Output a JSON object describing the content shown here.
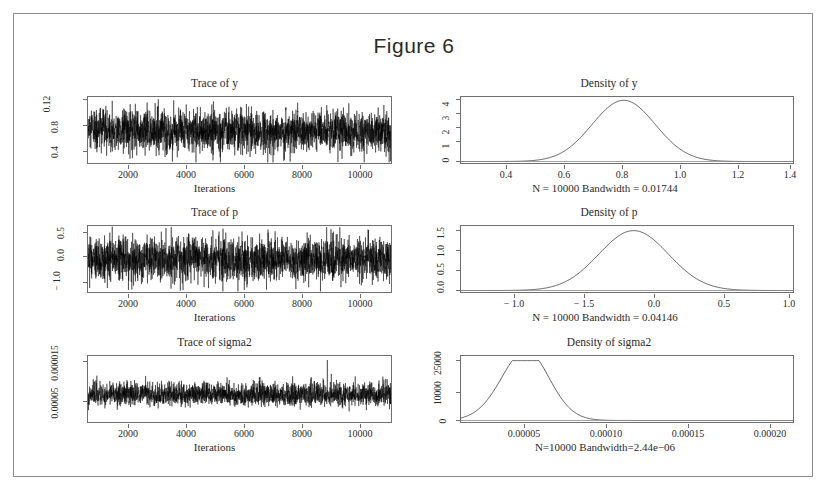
{
  "figure": {
    "title": "Figure 6"
  },
  "panels": [
    {
      "title": "Trace of y",
      "xlabel": "Iterations",
      "xticks": [
        "2000",
        "4000",
        "6000",
        "8000",
        "10000"
      ],
      "yticks": [
        "0.4",
        "0.8",
        "0.12"
      ]
    },
    {
      "title": "Density of y",
      "xlabel": "N = 10000 Bandwidth = 0.01744",
      "xticks": [
        "0.4",
        "0.6",
        "0.8",
        "1.0",
        "1.2",
        "1.4"
      ],
      "yticks": [
        "0",
        "1",
        "2",
        "3",
        "4"
      ]
    },
    {
      "title": "Trace of p",
      "xlabel": "Iterations",
      "xticks": [
        "2000",
        "4000",
        "6000",
        "8000",
        "10000"
      ],
      "yticks": [
        "− 1.0",
        "0.0",
        "0.5"
      ]
    },
    {
      "title": "Density of p",
      "xlabel": "N = 10000 Bandwidth = 0.04146",
      "xticks": [
        "− 1.0",
        "− 1.5",
        "0.0",
        "0.5",
        "1.0"
      ],
      "yticks": [
        "0.0",
        "0.5",
        "1.0",
        "1.5"
      ]
    },
    {
      "title": "Trace of sigma2",
      "xlabel": "Iterations",
      "xticks": [
        "2000",
        "4000",
        "6000",
        "8000",
        "10000"
      ],
      "yticks": [
        "0.00005",
        "0.000015"
      ]
    },
    {
      "title": "Density of sigma2",
      "xlabel": "N=10000 Bandwidth=2.44e−06",
      "xticks": [
        "0.00005",
        "0.00010",
        "0.00015",
        "0.00020"
      ],
      "yticks": [
        "0",
        "10000",
        "25000"
      ]
    }
  ],
  "chart_data": [
    {
      "type": "line",
      "title": "Trace of y",
      "xlabel": "Iterations",
      "ylabel": "y",
      "xlim": [
        1000,
        11000
      ],
      "ylim": [
        0.35,
        1.3
      ],
      "ytick_values": [
        0.4,
        0.8,
        1.2
      ],
      "xtick_values": [
        2000,
        4000,
        6000,
        8000,
        10000
      ],
      "series_description": "MCMC trace, stationary white-noise band centred near 0.83 with spread roughly 0.6 to 1.1",
      "mean": 0.83,
      "sd": 0.105,
      "n": 10000
    },
    {
      "type": "line",
      "title": "Density of y",
      "xlabel": "N = 10000 Bandwidth = 0.01744",
      "ylabel": "Density",
      "xlim": [
        0.27,
        1.42
      ],
      "ylim": [
        0,
        4.2
      ],
      "xtick_values": [
        0.4,
        0.6,
        0.8,
        1.0,
        1.2,
        1.4
      ],
      "ytick_values": [
        0,
        1,
        2,
        3,
        4
      ],
      "series_description": "Unimodal kernel density, peak height about 3.9 at x = 0.83",
      "peak_x": 0.83,
      "peak_y": 3.9,
      "n": 10000,
      "bandwidth": 0.01744
    },
    {
      "type": "line",
      "title": "Trace of p",
      "xlabel": "Iterations",
      "ylabel": "p",
      "xlim": [
        1000,
        11000
      ],
      "ylim": [
        -1.2,
        0.75
      ],
      "ytick_values": [
        -1.0,
        0.0,
        0.5
      ],
      "xtick_values": [
        2000,
        4000,
        6000,
        8000,
        10000
      ],
      "series_description": "MCMC trace, stationary band centred near -0.06 spanning roughly -0.9 to 0.6",
      "mean": -0.06,
      "sd": 0.25,
      "n": 10000
    },
    {
      "type": "line",
      "title": "Density of p",
      "xlabel": "N = 10000 Bandwidth = 0.04146",
      "ylabel": "Density",
      "xlim": [
        -1.25,
        1.05
      ],
      "ylim": [
        0,
        1.75
      ],
      "xtick_values": [
        -1.0,
        -0.5,
        0.0,
        0.5,
        1.0
      ],
      "ytick_values": [
        0.0,
        0.5,
        1.0,
        1.5
      ],
      "series_description": "Unimodal kernel density, peak height about 1.6 at x = -0.06",
      "peak_x": -0.06,
      "peak_y": 1.6,
      "n": 10000,
      "bandwidth": 0.04146
    },
    {
      "type": "line",
      "title": "Trace of sigma2",
      "xlabel": "Iterations",
      "ylabel": "sigma2",
      "xlim": [
        1000,
        11000
      ],
      "ylim": [
        3e-05,
        0.000165
      ],
      "ytick_values": [
        5e-05,
        0.00015
      ],
      "xtick_values": [
        2000,
        4000,
        6000,
        8000,
        10000
      ],
      "series_description": "MCMC trace centred near 7.6e-05, right-skewed with occasional upward spikes; largest spike near iteration 8900 reaching about 0.00015",
      "mean": 7.6e-05,
      "spike_iteration": 8900,
      "spike_value": 0.00015,
      "n": 10000
    },
    {
      "type": "line",
      "title": "Density of sigma2",
      "xlabel": "N=10000 Bandwidth=2.44e−06",
      "ylabel": "Density",
      "xlim": [
        3e-05,
        0.000225
      ],
      "ylim": [
        0,
        30000
      ],
      "xtick_values": [
        5e-05,
        0.0001,
        0.00015,
        0.0002
      ],
      "ytick_values": [
        0,
        10000,
        25000
      ],
      "series_description": "Right-skewed unimodal kernel density, peak height about 28000 at x = 7.3e-05 with a long right tail",
      "peak_x": 7.3e-05,
      "peak_y": 28000,
      "n": 10000,
      "bandwidth": 2.44e-06
    }
  ]
}
